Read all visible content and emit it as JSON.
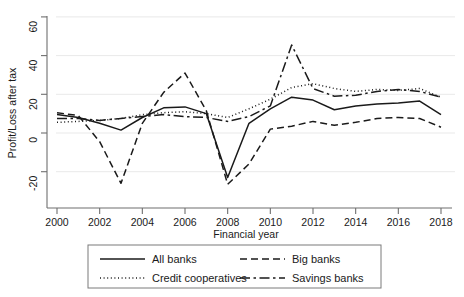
{
  "chart_data": {
    "type": "line",
    "title": "",
    "xlabel": "Financial year",
    "ylabel": "Profit/Loss after tax",
    "x": [
      2000,
      2001,
      2002,
      2003,
      2004,
      2005,
      2006,
      2007,
      2008,
      2009,
      2010,
      2011,
      2012,
      2013,
      2014,
      2015,
      2016,
      2017,
      2018
    ],
    "xlim": [
      2000,
      2018
    ],
    "ylim": [
      -30,
      62
    ],
    "xticks": [
      2000,
      2002,
      2004,
      2006,
      2008,
      2010,
      2012,
      2014,
      2016,
      2018
    ],
    "yticks": [
      -20,
      0,
      20,
      40,
      60
    ],
    "grid": "horizontal",
    "legend_position": "bottom",
    "series": [
      {
        "name": "All banks",
        "style": "solid",
        "values": [
          9.5,
          8.0,
          5.0,
          1.5,
          8.0,
          13.0,
          13.5,
          10.0,
          -23.0,
          5.0,
          12.5,
          18.5,
          17.0,
          12.0,
          14.0,
          15.0,
          15.5,
          16.5,
          9.5
        ]
      },
      {
        "name": "Credit cooperatives",
        "style": "dotted",
        "values": [
          5.5,
          6.0,
          6.5,
          7.5,
          9.5,
          10.5,
          11.0,
          10.0,
          8.0,
          12.5,
          17.5,
          23.5,
          25.5,
          23.0,
          21.5,
          22.5,
          22.0,
          23.0,
          18.5
        ]
      },
      {
        "name": "Big banks",
        "style": "dashed",
        "values": [
          10.5,
          9.0,
          -4.5,
          -26.0,
          5.0,
          21.0,
          31.0,
          11.5,
          -26.5,
          -16.0,
          2.0,
          3.5,
          6.0,
          4.0,
          5.5,
          7.5,
          8.0,
          7.5,
          3.0
        ]
      },
      {
        "name": "Savings banks",
        "style": "dashdot",
        "values": [
          7.5,
          7.5,
          6.5,
          7.5,
          8.5,
          9.5,
          8.5,
          8.0,
          6.0,
          8.5,
          14.0,
          45.5,
          23.0,
          19.0,
          19.5,
          21.5,
          22.5,
          21.5,
          18.5
        ]
      }
    ],
    "legend_entries": [
      {
        "label": "All banks",
        "style": "solid"
      },
      {
        "label": "Big banks",
        "style": "dashed"
      },
      {
        "label": "Credit cooperatives",
        "style": "dotted"
      },
      {
        "label": "Savings banks",
        "style": "dashdot"
      }
    ]
  }
}
